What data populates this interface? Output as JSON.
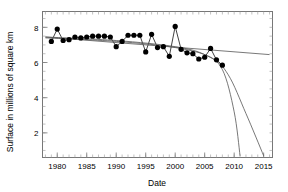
{
  "chart_data": {
    "type": "line",
    "title": "",
    "xlabel": "Date",
    "ylabel": "Surface in millions of square km",
    "xlim": [
      1977.5,
      2016.5
    ],
    "ylim": [
      0.6,
      8.9
    ],
    "xticks": [
      1980,
      1985,
      1990,
      1995,
      2000,
      2005,
      2010,
      2015
    ],
    "xtick_labels": [
      "1980",
      "1985",
      "1990",
      "1995",
      "2000",
      "2005",
      "2010",
      "2015"
    ],
    "yticks": [
      2,
      4,
      6,
      8
    ],
    "ytick_labels": [
      "2",
      "4",
      "6",
      "8"
    ],
    "grid": false,
    "legend": "none",
    "marker": "filled-circle",
    "series": [
      {
        "name": "Observed surface",
        "kind": "markers-with-line",
        "color": "#000000",
        "x": [
          1979,
          1980,
          1981,
          1982,
          1983,
          1984,
          1985,
          1986,
          1987,
          1988,
          1989,
          1990,
          1991,
          1992,
          1993,
          1994,
          1995,
          1996,
          1997,
          1998,
          1999,
          2000,
          2001,
          2002,
          2003,
          2004,
          2005,
          2006,
          2007,
          2008
        ],
        "values": [
          7.2,
          7.9,
          7.25,
          7.3,
          7.45,
          7.4,
          7.45,
          7.5,
          7.5,
          7.5,
          7.45,
          6.9,
          7.2,
          7.55,
          7.55,
          7.55,
          6.6,
          7.6,
          6.85,
          6.9,
          6.35,
          8.05,
          6.75,
          6.55,
          6.5,
          6.2,
          6.3,
          6.8,
          6.15,
          5.85
        ],
        "units": "million square km"
      },
      {
        "name": "Linear trend",
        "kind": "trend-line",
        "color": "#555555",
        "x": [
          1978,
          2016
        ],
        "values": [
          7.45,
          6.45
        ]
      },
      {
        "name": "Projection curve A",
        "kind": "trend-curve",
        "color": "#555555",
        "x": [
          1978,
          1990,
          2000,
          2005,
          2008,
          2010,
          2011
        ],
        "values": [
          7.45,
          7.25,
          6.9,
          6.45,
          5.6,
          3.2,
          0.7
        ]
      },
      {
        "name": "Projection curve B",
        "kind": "trend-curve",
        "color": "#555555",
        "x": [
          1978,
          1990,
          2000,
          2006,
          2009,
          2012,
          2015
        ],
        "values": [
          7.4,
          7.2,
          6.85,
          6.3,
          5.3,
          3.1,
          0.7
        ]
      }
    ]
  },
  "axes": {
    "x_title": "Date",
    "y_title": "Surface in millions of square km"
  }
}
